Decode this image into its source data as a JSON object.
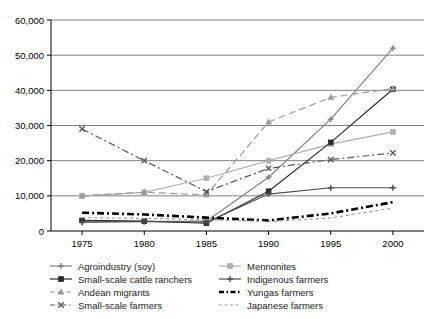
{
  "top_cut_text": "",
  "chart_data": {
    "type": "line",
    "title": "",
    "subtitle": "",
    "xlabel": "",
    "ylabel": "",
    "x": [
      1975,
      1980,
      1985,
      1990,
      1995,
      2000
    ],
    "xtick_labels": [
      "1975",
      "1980",
      "1985",
      "1990",
      "1995",
      "2000"
    ],
    "ytick_labels": [
      "0",
      "10,000",
      "20,000",
      "30,000",
      "40,000",
      "50,000",
      "60,000"
    ],
    "yticks": [
      0,
      10000,
      20000,
      30000,
      40000,
      50000,
      60000
    ],
    "xlim": [
      1972.5,
      2002.5
    ],
    "ylim": [
      0,
      60000
    ],
    "grid": "horizontal",
    "legend_position": "bottom",
    "legend_columns": 2,
    "series": [
      {
        "name": "Agroindustry (soy)",
        "color": "#808080",
        "values": [
          2500,
          2700,
          2800,
          15300,
          31800,
          52000
        ],
        "style": "solid",
        "marker": "cross"
      },
      {
        "name": "Mennonites",
        "color": "#b0b0b0",
        "values": [
          10000,
          11000,
          15000,
          20000,
          24700,
          28200
        ],
        "style": "solid",
        "marker": "square"
      },
      {
        "name": "Small-scale cattle ranchers",
        "color": "#2a2a2a",
        "values": [
          3000,
          2800,
          2200,
          11300,
          25200,
          40300
        ],
        "style": "solid",
        "marker": "square"
      },
      {
        "name": "Indigenous farmers",
        "color": "#4d4d4d",
        "values": [
          2500,
          2700,
          2500,
          10500,
          12300,
          12300
        ],
        "style": "solid",
        "marker": "cross"
      },
      {
        "name": "Andean migrants",
        "color": "#9a9a9a",
        "values": [
          10000,
          11000,
          10300,
          31000,
          38000,
          40500
        ],
        "style": "dashed",
        "marker": "triangle"
      },
      {
        "name": "Yungas farmers",
        "color": "#000000",
        "values": [
          5200,
          4700,
          3800,
          3000,
          5000,
          8200
        ],
        "style": "dash-dot-bold",
        "marker": "none"
      },
      {
        "name": "Small-scale farmers",
        "color": "#585858",
        "values": [
          29000,
          20000,
          11200,
          17800,
          20300,
          22200
        ],
        "style": "dash-dot",
        "marker": "x"
      },
      {
        "name": "Japanese farmers",
        "color": "#9a9a9a",
        "values": [
          3800,
          3600,
          3200,
          2700,
          3700,
          6500
        ],
        "style": "fine-dashed",
        "marker": "none"
      }
    ],
    "legend_order": [
      "Agroindustry (soy)",
      "Mennonites",
      "Small-scale cattle ranchers",
      "Indigenous farmers",
      "Andean migrants",
      "Yungas farmers",
      "Small-scale farmers",
      "Japanese farmers"
    ]
  }
}
